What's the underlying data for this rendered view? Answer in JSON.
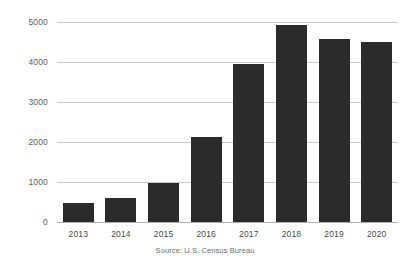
{
  "chart_data": {
    "type": "bar",
    "title": "",
    "subtitle": "",
    "xlabel": "",
    "ylabel": "",
    "categories": [
      "2013",
      "2014",
      "2015",
      "2016",
      "2017",
      "2018",
      "2019",
      "2020"
    ],
    "values": [
      480,
      590,
      980,
      2130,
      3950,
      4920,
      4580,
      4500
    ],
    "series": [
      {
        "name": "",
        "values": [
          480,
          590,
          980,
          2130,
          3950,
          4920,
          4580,
          4500
        ]
      }
    ],
    "ylim": [
      0,
      5000
    ],
    "yticks": [
      0,
      1000,
      2000,
      3000,
      4000,
      5000
    ],
    "ytick_labels": [
      "0",
      "1000",
      "2000",
      "3000",
      "4000",
      "5000"
    ],
    "grid": true,
    "grid_axis": "y",
    "legend": false,
    "legend_position": "none",
    "bar_color": "#2b2b2b",
    "gridline_color": "#c9c9c9",
    "background_color": "#ffffff",
    "annotations": [
      "Source: U.S. Census Bureau"
    ]
  },
  "source_note": "Source: U.S. Census Bureau"
}
